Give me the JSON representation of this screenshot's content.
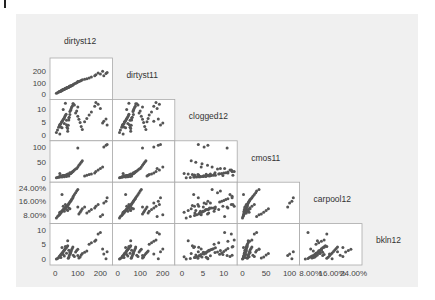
{
  "chart_data": {
    "type": "scatter",
    "subtype": "scatterplot-matrix-lower-triangle",
    "title": "",
    "variables": [
      {
        "name": "dirtyst12",
        "range": [
          0,
          280
        ],
        "ticks": [
          0,
          100,
          200
        ],
        "tick_labels": [
          "0",
          "100",
          "200"
        ]
      },
      {
        "name": "dirtyst11",
        "range": [
          -5,
          240
        ],
        "ticks": [
          0,
          5,
          10
        ],
        "tick_labels": [
          "0",
          "5",
          "10"
        ]
      },
      {
        "name": "clogged12",
        "range": [
          -1,
          13
        ],
        "ticks": [
          0,
          50,
          100
        ],
        "tick_labels": [
          "0",
          "50",
          "100"
        ]
      },
      {
        "name": "cmos11",
        "range": [
          -5,
          110
        ],
        "ticks": [
          0.08,
          0.16,
          0.24
        ],
        "tick_labels": [
          "8.00%",
          "16.00%",
          "24.00%"
        ]
      },
      {
        "name": "carpool12",
        "range": [
          0.03,
          0.26
        ],
        "ticks": [
          0,
          5,
          10
        ],
        "tick_labels": [
          "0",
          "5",
          "10"
        ]
      },
      {
        "name": "bkln12",
        "range": [
          -1,
          11
        ],
        "ticks": [],
        "tick_labels": []
      }
    ],
    "x_axis_ticks": [
      {
        "column": "dirtyst12",
        "values": [
          0,
          100,
          200
        ],
        "labels": [
          "0",
          "100",
          "200"
        ]
      },
      {
        "column": "dirtyst11",
        "values": [
          0,
          100,
          200
        ],
        "labels": [
          "0",
          "100",
          "200"
        ]
      },
      {
        "column": "clogged12",
        "values": [
          0,
          5,
          10
        ],
        "labels": [
          "0",
          "5",
          "10"
        ]
      },
      {
        "column": "cmos11",
        "values": [
          0,
          50,
          100
        ],
        "labels": [
          "0",
          "50",
          "100"
        ]
      },
      {
        "column": "carpool12",
        "values": [
          0.08,
          0.16,
          0.24
        ],
        "labels": [
          "8.00%",
          "16.00%",
          "24.00%"
        ]
      }
    ],
    "y_axis_ticks": [
      {
        "row": "dirtyst11",
        "values": [
          0,
          100,
          200
        ],
        "labels": [
          "0",
          "100",
          "200"
        ]
      },
      {
        "row": "clogged12",
        "values": [
          0,
          5,
          10
        ],
        "labels": [
          "0",
          "5",
          "10"
        ]
      },
      {
        "row": "cmos11",
        "values": [
          0,
          50,
          100
        ],
        "labels": [
          "0",
          "50",
          "100"
        ]
      },
      {
        "row": "carpool12",
        "values": [
          0.08,
          0.16,
          0.24
        ],
        "labels": [
          "8.00%",
          "16.00%",
          "24.00%"
        ]
      },
      {
        "row": "bkln12",
        "values": [
          0,
          5,
          10
        ],
        "labels": [
          "0",
          "5",
          "10"
        ]
      }
    ],
    "grid": false,
    "legend": null,
    "point_color": "#555555",
    "observations": {
      "dirtyst12": [
        5,
        10,
        15,
        18,
        20,
        22,
        25,
        28,
        30,
        32,
        35,
        38,
        40,
        42,
        45,
        48,
        50,
        52,
        55,
        58,
        60,
        62,
        65,
        68,
        70,
        72,
        75,
        78,
        80,
        85,
        90,
        95,
        100,
        105,
        110,
        115,
        120,
        130,
        140,
        150,
        160,
        175,
        180,
        190,
        200,
        210,
        215,
        225,
        230,
        30,
        40,
        50,
        60,
        25,
        35,
        45,
        55,
        20,
        65,
        100
      ],
      "dirtyst11": [
        8,
        12,
        18,
        20,
        22,
        25,
        28,
        30,
        32,
        35,
        38,
        40,
        42,
        45,
        48,
        50,
        52,
        55,
        58,
        60,
        62,
        65,
        68,
        70,
        72,
        75,
        78,
        80,
        85,
        90,
        95,
        100,
        105,
        110,
        115,
        120,
        125,
        130,
        135,
        140,
        150,
        160,
        170,
        185,
        175,
        200,
        160,
        180,
        190,
        35,
        45,
        55,
        62,
        28,
        40,
        50,
        58,
        24,
        70,
        110
      ],
      "clogged12": [
        1,
        2,
        3,
        3.5,
        4,
        4.2,
        4.5,
        5,
        5.2,
        5.5,
        6,
        6.3,
        6.5,
        7,
        7.5,
        8,
        4,
        3,
        2.5,
        3.8,
        5.8,
        6.8,
        9,
        9.5,
        10,
        10.5,
        11,
        12,
        12,
        11.5,
        8.5,
        9.2,
        7.2,
        6.1,
        4.8,
        3.3,
        2.2,
        5.1,
        6.4,
        7.7,
        8.8,
        11,
        12.5,
        11.8,
        10.2,
        4.6,
        5.3,
        6.2,
        3.9,
        2.8,
        4.4,
        5.7,
        6.6,
        3.1,
        9.8,
        12.2,
        1.5,
        0.5,
        7.9,
        10.8
      ],
      "cmos11": [
        0,
        1,
        2,
        2,
        3,
        3,
        4,
        4,
        5,
        5,
        6,
        6,
        7,
        7,
        8,
        8,
        9,
        9,
        10,
        10,
        11,
        12,
        13,
        14,
        15,
        16,
        18,
        20,
        22,
        25,
        28,
        30,
        35,
        40,
        45,
        50,
        55,
        5,
        8,
        10,
        12,
        15,
        20,
        25,
        30,
        35,
        100,
        105,
        108,
        2,
        3,
        4,
        5,
        6,
        7,
        8,
        12,
        14,
        16,
        96
      ],
      "carpool12": [
        0.06,
        0.07,
        0.075,
        0.08,
        0.085,
        0.09,
        0.095,
        0.1,
        0.1,
        0.105,
        0.11,
        0.11,
        0.115,
        0.12,
        0.12,
        0.125,
        0.13,
        0.13,
        0.135,
        0.14,
        0.145,
        0.15,
        0.155,
        0.16,
        0.165,
        0.17,
        0.175,
        0.18,
        0.19,
        0.2,
        0.21,
        0.22,
        0.23,
        0.085,
        0.095,
        0.105,
        0.115,
        0.125,
        0.09,
        0.1,
        0.11,
        0.12,
        0.13,
        0.14,
        0.07,
        0.08,
        0.15,
        0.16,
        0.18,
        0.2,
        0.1,
        0.11,
        0.12,
        0.09,
        0.13,
        0.14,
        0.105,
        0.095,
        0.115,
        0.125
      ],
      "bkln12": [
        0,
        0.2,
        0.5,
        0.8,
        1,
        1.2,
        1.5,
        1.8,
        2,
        2.2,
        2.5,
        2.8,
        3,
        3.2,
        3.5,
        3.8,
        4,
        4.2,
        4.5,
        0.3,
        0.6,
        1.1,
        1.6,
        2.1,
        2.6,
        3.1,
        3.6,
        4.1,
        1.3,
        0.9,
        2.4,
        2.9,
        3.3,
        0.4,
        0.7,
        1.4,
        1.9,
        2.3,
        2.7,
        5,
        5.5,
        6,
        6.5,
        8.5,
        9,
        3.4,
        1.7,
        0.1,
        2.5,
        3.9,
        1,
        2,
        3,
        0.5,
        1.5,
        4.3,
        6.2,
        0.8,
        2.2,
        1.2
      ]
    },
    "layout": {
      "panel_left": 50,
      "panel_top": 58,
      "panel_width": 62.4,
      "panel_height": 41.4,
      "n": 5
    }
  }
}
